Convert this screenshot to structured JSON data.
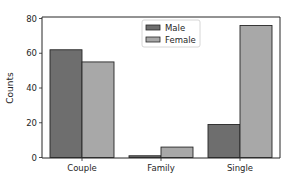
{
  "chart_data": {
    "type": "bar",
    "title": "",
    "xlabel": "",
    "ylabel": "Counts",
    "categories": [
      "Couple",
      "Family",
      "Single"
    ],
    "series": [
      {
        "name": "Male",
        "values": [
          62,
          1,
          19
        ],
        "color": "#6e6e6e"
      },
      {
        "name": "Female",
        "values": [
          55,
          6,
          76
        ],
        "color": "#a8a8a8"
      }
    ],
    "ylim": [
      0,
      81
    ],
    "yticks": [
      0,
      20,
      40,
      60,
      80
    ],
    "grid": false,
    "legend_position": "upper center",
    "edge_color": "#262626"
  },
  "axes": {
    "ylabel": "Counts",
    "ytick_labels": [
      "0",
      "20",
      "40",
      "60",
      "80"
    ],
    "xtick_labels": [
      "Couple",
      "Family",
      "Single"
    ]
  },
  "legend": {
    "items": [
      {
        "label": "Male",
        "color": "#6e6e6e"
      },
      {
        "label": "Female",
        "color": "#a8a8a8"
      }
    ]
  }
}
